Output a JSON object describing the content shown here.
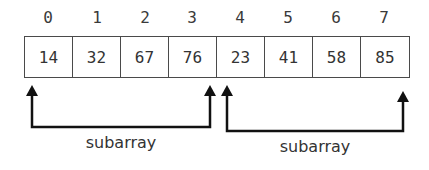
{
  "diagram": {
    "indices": [
      "0",
      "1",
      "2",
      "3",
      "4",
      "5",
      "6",
      "7"
    ],
    "values": [
      "14",
      "32",
      "67",
      "76",
      "23",
      "41",
      "58",
      "85"
    ],
    "subarrays": [
      {
        "label": "subarray",
        "start_index": 0,
        "end_index": 3
      },
      {
        "label": "subarray",
        "start_index": 4,
        "end_index": 7
      }
    ],
    "colors": {
      "stroke": "#111111",
      "border": "#4a4a4a",
      "text": "#333333"
    }
  }
}
